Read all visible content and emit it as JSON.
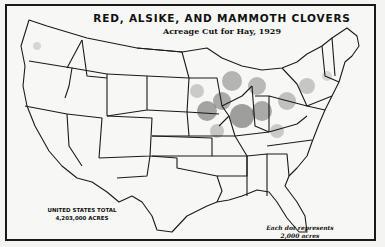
{
  "map": {
    "title": "RED, ALSIKE, AND MAMMOTH CLOVERS",
    "subtitle": "Acreage Cut for Hay, 1929",
    "total": {
      "line1": "UNITED STATES TOTAL",
      "line2": "4,203,000 ACRES"
    },
    "legend": {
      "line1": "Each dot represents",
      "line2": "2,000 acres"
    },
    "colors": {
      "ink": "#1a1a1a",
      "paper": "#f7f7f5"
    }
  }
}
